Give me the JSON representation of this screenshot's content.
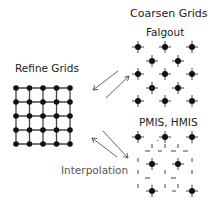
{
  "labels": {
    "refine": "Refine Grids",
    "coarsen": "Coarsen Grids",
    "falgout": "Falgout",
    "pmis": "PMIS, HMIS",
    "interpolation": "Interpolation"
  },
  "colors": {
    "node": "#111111",
    "line": "#444444",
    "arrow": "#555555"
  },
  "refine_grid": {
    "rows": 5,
    "cols": 5,
    "x": [
      16,
      29.5,
      43,
      56.5,
      70
    ],
    "y": [
      88,
      102,
      116,
      130,
      144
    ]
  },
  "falgout_nodes": [
    [
      138,
      47
    ],
    [
      165,
      47
    ],
    [
      192,
      47
    ],
    [
      152,
      61
    ],
    [
      178,
      61
    ],
    [
      138,
      74
    ],
    [
      165,
      74
    ],
    [
      192,
      74
    ],
    [
      152,
      88
    ],
    [
      178,
      88
    ],
    [
      138,
      101
    ],
    [
      165,
      101
    ],
    [
      192,
      101
    ]
  ],
  "pmis_nodes": [
    [
      138,
      137
    ],
    [
      165,
      137
    ],
    [
      192,
      137
    ],
    [
      152,
      164
    ],
    [
      178,
      164
    ],
    [
      152,
      191
    ],
    [
      192,
      191
    ]
  ]
}
